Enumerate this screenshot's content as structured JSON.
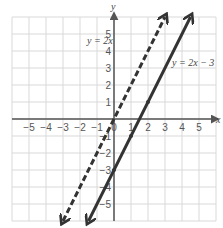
{
  "chart_data": {
    "type": "line",
    "title": "",
    "xlabel": "x",
    "ylabel": "y",
    "xlim": [
      -6,
      6
    ],
    "ylim": [
      -6,
      6
    ],
    "grid": true,
    "x_ticks": [
      -5,
      -4,
      -3,
      -2,
      -1,
      0,
      1,
      2,
      3,
      4,
      5
    ],
    "y_ticks": [
      -5,
      -4,
      -3,
      -2,
      -1,
      1,
      2,
      3,
      4,
      5
    ],
    "series": [
      {
        "name": "y = 2x",
        "equation": "y = 2x",
        "slope": 2,
        "intercept": 0,
        "style": "dashed",
        "color": "#333333",
        "points": [
          [
            -3,
            -6
          ],
          [
            0,
            0
          ],
          [
            3,
            6
          ]
        ]
      },
      {
        "name": "y = 2x − 3",
        "equation": "y = 2x − 3",
        "slope": 2,
        "intercept": -3,
        "style": "solid",
        "color": "#333333",
        "points": [
          [
            -1.5,
            -6
          ],
          [
            0,
            -3
          ],
          [
            1,
            -1
          ],
          [
            2,
            1
          ],
          [
            4.5,
            6
          ]
        ],
        "marked_points": [
          [
            0,
            -3
          ],
          [
            1,
            -1
          ],
          [
            2,
            1
          ]
        ]
      }
    ],
    "annotations": [
      {
        "text": "y = 2x",
        "near": [
          -1.5,
          4.7
        ]
      },
      {
        "text": "y = 2x − 3",
        "near": [
          4.2,
          3.6
        ]
      }
    ]
  },
  "labels": {
    "x_axis": "x",
    "y_axis": "y",
    "line1": "y = 2x",
    "line2": "y = 2x − 3"
  },
  "colors": {
    "grid": "#d9d9d9",
    "axis": "#555555",
    "line": "#333333",
    "text": "#555555"
  }
}
